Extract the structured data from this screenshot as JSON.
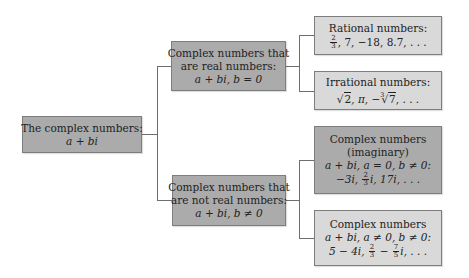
{
  "diagram": {
    "colors": {
      "dark_box": "#ababab",
      "light_box": "#d9d9d9",
      "border": "#7d7d7d",
      "connector": "#6e6e6e"
    },
    "nodes": {
      "root": {
        "line1": "The complex numbers:",
        "line2": "a + bi"
      },
      "real": {
        "line1": "Complex numbers that",
        "line2": "are real numbers:",
        "line3": "a + bi, b = 0"
      },
      "not_real": {
        "line1": "Complex numbers that",
        "line2": "are not real numbers:",
        "line3": "a + bi, b ≠ 0"
      },
      "rational": {
        "line1": "Rational numbers:",
        "frac_num": "2",
        "frac_den": "3",
        "rest": ", 7, −18, 8.7, . . ."
      },
      "irrational": {
        "line1": "Irrational numbers:",
        "sqrt2": "2",
        "pi": ", π, −",
        "cbrt_index": "3",
        "cbrt_radicand": "7",
        "rest": ", . . ."
      },
      "imaginary": {
        "line1": "Complex numbers",
        "line2": "(imaginary)",
        "line3": "a + bi, a = 0, b ≠ 0:",
        "ex_start": "−3i, ",
        "frac_num": "2",
        "frac_den": "3",
        "ex_end": "i, 17i, . . ."
      },
      "complex_nonzero": {
        "line1": "Complex numbers",
        "line2": "a + bi, a ≠ 0, b ≠ 0:",
        "ex_start": "5 − 4i, ",
        "frac1_num": "2",
        "frac1_den": "3",
        "minus": " − ",
        "frac2_num": "7",
        "frac2_den": "5",
        "ex_end": "i, . . ."
      }
    },
    "edges": [
      [
        "root",
        "real"
      ],
      [
        "root",
        "not_real"
      ],
      [
        "real",
        "rational"
      ],
      [
        "real",
        "irrational"
      ],
      [
        "not_real",
        "imaginary"
      ],
      [
        "not_real",
        "complex_nonzero"
      ]
    ]
  }
}
